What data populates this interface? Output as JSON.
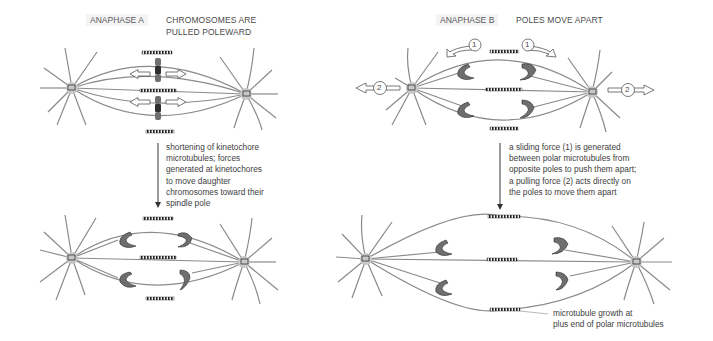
{
  "panels": {
    "anaphase_a": {
      "tag": "ANAPHASE A",
      "title_lines": [
        "CHROMOSOMES ARE",
        "PULLED POLEWARD"
      ],
      "description_lines": [
        "shortening of kinetochore",
        "microtubules; forces",
        "generated at kinetochores",
        "to move daughter",
        "chromosomes toward their",
        "spindle pole"
      ]
    },
    "anaphase_b": {
      "tag": "ANAPHASE B",
      "title": "POLES MOVE APART",
      "description_lines": [
        "a sliding force (1) is generated",
        "between polar microtubules from",
        "opposite poles to push them apart;",
        "a pulling force (2) acts directly on",
        "the poles to move them apart"
      ],
      "force_labels": {
        "sliding": "1",
        "pulling": "2"
      },
      "annotation_lines": [
        "microtubule growth at",
        "plus end of polar microtubules"
      ]
    }
  },
  "colors": {
    "microtubule": "#8a8a8a",
    "pole": "#c8c8c8",
    "chromosome": "#6e6e6e",
    "kinetochore": "#2e2e2e",
    "text": "#3e3e3e"
  }
}
